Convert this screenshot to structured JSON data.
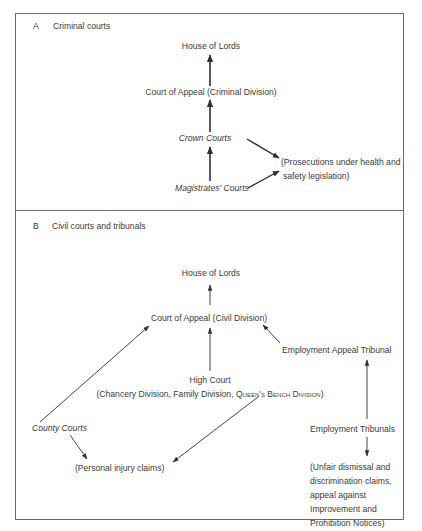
{
  "sections": [
    {
      "letter": "A",
      "title": "Criminal courts",
      "nodes": {
        "house_of_lords": "House of Lords",
        "court_of_appeal": "Court of Appeal (Criminal Division)",
        "crown_courts": "Crown Courts",
        "magistrates_courts": "Magistrates' Courts",
        "prosecutions_line1": "(Prosecutions under health and",
        "prosecutions_line2": "safety legislation)"
      },
      "edges": [
        [
          "Court of Appeal (Criminal Division)",
          "House of Lords"
        ],
        [
          "Crown Courts",
          "Court of Appeal (Criminal Division)"
        ],
        [
          "Magistrates' Courts",
          "Crown Courts"
        ],
        [
          "Crown Courts",
          "(Prosecutions under health and safety legislation)"
        ],
        [
          "Magistrates' Courts",
          "(Prosecutions under health and safety legislation)"
        ]
      ]
    },
    {
      "letter": "B",
      "title": "Civil courts and tribunals",
      "nodes": {
        "house_of_lords": "House of Lords",
        "court_of_appeal": "Court of Appeal (Civil Division)",
        "employment_appeal_tribunal": "Employment Appeal Tribunal",
        "high_court": "High Court",
        "high_court_divisions_prefix": "(Chancery Division, Family Division, ",
        "high_court_divisions_sc": "Queen's Bench Division",
        "high_court_divisions_suffix": ")",
        "county_courts": "County Courts",
        "personal_injury": "(Personal injury claims)",
        "employment_tribunals": "Employment Tribunals",
        "unfair_line1": "(Unfair dismissal and",
        "unfair_line2": "discrimination claims,",
        "unfair_line3": "appeal against",
        "unfair_line4": "Improvement and",
        "unfair_line5": "Prohibition Notices)"
      },
      "edges": [
        [
          "Court of Appeal (Civil Division)",
          "House of Lords"
        ],
        [
          "High Court",
          "Court of Appeal (Civil Division)"
        ],
        [
          "Employment Appeal Tribunal",
          "Court of Appeal (Civil Division)"
        ],
        [
          "County Courts",
          "Court of Appeal (Civil Division)"
        ],
        [
          "County Courts",
          "(Personal injury claims)"
        ],
        [
          "High Court",
          "(Personal injury claims)"
        ],
        [
          "Employment Tribunals",
          "Employment Appeal Tribunal"
        ],
        [
          "Employment Tribunals",
          "(Unfair dismissal and discrimination claims, appeal against Improvement and Prohibition Notices)"
        ]
      ]
    }
  ]
}
